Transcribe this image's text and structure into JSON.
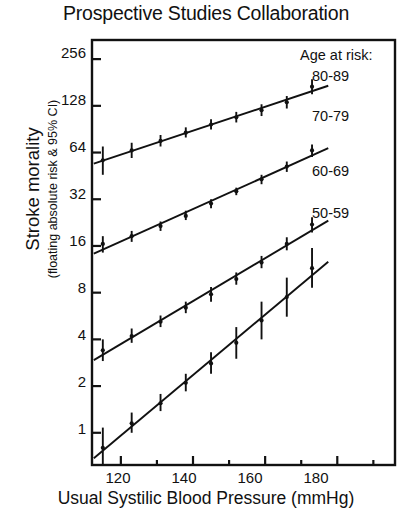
{
  "chart_data": {
    "type": "scatter",
    "title": "Prospective Studies Collaboration",
    "xlabel": "Usual Systilic Blood Pressure (mmHg)",
    "ylabel": "Stroke morality",
    "ylabel_sub": "(floating absolute risk & 95% CI)",
    "yscale": "log2",
    "ylim": [
      0.62,
      340
    ],
    "xlim": [
      112,
      196
    ],
    "grid": false,
    "legend_position": "top-right-inside",
    "legend_title": "Age at risk:",
    "yticks": [
      1,
      2,
      4,
      8,
      16,
      32,
      64,
      128,
      256
    ],
    "ytick_labels": [
      "1",
      "2",
      "4",
      "8",
      "16",
      "32",
      "64",
      "128",
      "256"
    ],
    "xticks_major": [
      120,
      140,
      160,
      180
    ],
    "xtick_labels": [
      "120",
      "140",
      "160",
      "180"
    ],
    "xticks_minor": [
      130,
      150,
      170,
      190
    ],
    "series": [
      {
        "name": "80-89",
        "x": [
          115,
          123,
          131,
          138,
          145,
          152,
          159,
          166,
          173
        ],
        "y": [
          57,
          66,
          76,
          86,
          97,
          108,
          120,
          135,
          170
        ],
        "ylow": [
          46,
          59,
          70,
          80,
          90,
          100,
          110,
          123,
          152
        ],
        "yhigh": [
          70,
          74,
          83,
          93,
          105,
          117,
          131,
          148,
          190
        ]
      },
      {
        "name": "70-79",
        "x": [
          115,
          123,
          131,
          138,
          145,
          152,
          159,
          166,
          173
        ],
        "y": [
          16.5,
          18.5,
          21.5,
          25,
          30,
          36,
          43,
          52,
          66
        ],
        "ylow": [
          14.5,
          17,
          20,
          23.5,
          28,
          34,
          40,
          48,
          60
        ],
        "yhigh": [
          18.5,
          20,
          23,
          27,
          32,
          38,
          46,
          56,
          72
        ]
      },
      {
        "name": "60-69",
        "x": [
          115,
          123,
          131,
          138,
          145,
          152,
          159,
          166,
          173
        ],
        "y": [
          3.4,
          4.2,
          5.2,
          6.4,
          7.8,
          9.8,
          12.5,
          16.5,
          22
        ],
        "ylow": [
          2.9,
          3.8,
          4.8,
          5.9,
          7.0,
          9.0,
          11.5,
          15.0,
          19.5
        ],
        "yhigh": [
          4.0,
          4.7,
          5.7,
          7.0,
          8.7,
          10.8,
          13.8,
          18.2,
          24.5
        ]
      },
      {
        "name": "50-59",
        "x": [
          115,
          123,
          131,
          138,
          145,
          152,
          159,
          166,
          173
        ],
        "y": [
          0.8,
          1.15,
          1.55,
          2.1,
          2.8,
          3.8,
          5.3,
          7.5,
          11.5
        ],
        "ylow": [
          0.62,
          1.0,
          1.38,
          1.85,
          2.4,
          3.0,
          4.0,
          5.6,
          8.6
        ],
        "yhigh": [
          1.08,
          1.35,
          1.78,
          2.4,
          3.3,
          4.8,
          7.0,
          10.0,
          15.5
        ]
      }
    ],
    "legend_entries": [
      "80-89",
      "70-79",
      "60-69",
      "50-59"
    ]
  },
  "axes": {
    "ytick_labels": [
      "256",
      "128",
      "64",
      "32",
      "16",
      "8",
      "4",
      "2",
      "1"
    ],
    "xtick_labels": [
      "120",
      "140",
      "160",
      "180"
    ]
  }
}
